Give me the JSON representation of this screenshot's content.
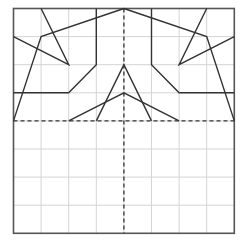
{
  "diagram": {
    "type": "grid-line-drawing",
    "grid": {
      "cols": 8,
      "rows": 8,
      "color": "#d4d4d4",
      "border_color": "#555555"
    },
    "origin_px": [
      13.5,
      8.5
    ],
    "cell_px": [
      27.6,
      28.1
    ],
    "axes_of_symmetry": [
      {
        "name": "horizontal-fold-line",
        "from": [
          0,
          4
        ],
        "to": [
          8,
          4
        ],
        "style": "dashed"
      },
      {
        "name": "vertical-fold-line",
        "from": [
          4,
          0
        ],
        "to": [
          4,
          8
        ],
        "style": "dashed"
      }
    ],
    "line_color": "#333333",
    "polylines": [
      {
        "name": "left-outer-edge",
        "points": [
          [
            0,
            4
          ],
          [
            1,
            1
          ],
          [
            4,
            0
          ]
        ]
      },
      {
        "name": "left-small-triangle",
        "points": [
          [
            1,
            0
          ],
          [
            2,
            2
          ],
          [
            0,
            1
          ]
        ]
      },
      {
        "name": "left-inner-bracket",
        "points": [
          [
            3,
            0
          ],
          [
            3,
            2
          ],
          [
            2,
            3
          ],
          [
            0,
            3
          ]
        ]
      },
      {
        "name": "right-outer-edge",
        "points": [
          [
            8,
            4
          ],
          [
            7,
            1
          ],
          [
            4,
            0
          ]
        ]
      },
      {
        "name": "right-small-triangle",
        "points": [
          [
            7,
            0
          ],
          [
            6,
            2
          ],
          [
            8,
            1
          ]
        ]
      },
      {
        "name": "right-inner-bracket",
        "points": [
          [
            5,
            0
          ],
          [
            5,
            2
          ],
          [
            6,
            3
          ],
          [
            8,
            3
          ]
        ]
      },
      {
        "name": "center-tall-peak",
        "points": [
          [
            3,
            4
          ],
          [
            4,
            2
          ],
          [
            5,
            4
          ]
        ]
      },
      {
        "name": "center-wide-peak",
        "points": [
          [
            2,
            4
          ],
          [
            4,
            3
          ],
          [
            6,
            4
          ]
        ]
      }
    ]
  }
}
